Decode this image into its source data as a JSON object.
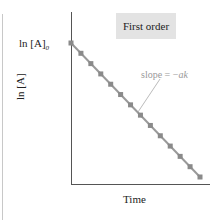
{
  "chart_data": {
    "type": "line",
    "title": "First order",
    "xlabel": "Time",
    "ylabel": "ln [A]",
    "y_intercept_label": "ln [A]0",
    "annotation": "slope = -ak",
    "grid": false,
    "legend": null,
    "series": [
      {
        "name": "ln [A] vs time",
        "x": [
          0,
          1,
          2,
          3,
          4,
          5,
          6,
          7,
          8,
          9,
          10,
          11,
          12,
          13
        ],
        "values": [
          13,
          12,
          11,
          10,
          9,
          8,
          7,
          6,
          5,
          4,
          3,
          2,
          1,
          0
        ]
      }
    ],
    "colors": {
      "line": "#999999",
      "marker": "#8a8a8a",
      "box": "#e3e3e3",
      "axis": "#555555"
    }
  },
  "labels": {
    "box": "First order",
    "ylabel": "ln [A]",
    "y0_main": "ln [A]",
    "y0_sub": "0",
    "xlabel": "Time",
    "slope_prefix": "slope = −",
    "slope_var": "ak"
  }
}
